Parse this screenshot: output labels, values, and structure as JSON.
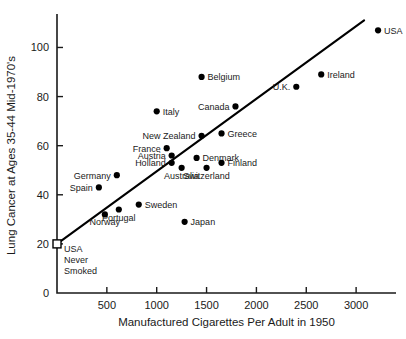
{
  "chart_data": {
    "type": "scatter",
    "title": "",
    "xlabel": "Manufactured Cigarettes Per Adult in 1950",
    "ylabel": "Lung Cancer at Ages 35-44 Mid-1970's",
    "xlim": [
      0,
      3400
    ],
    "ylim": [
      0,
      112
    ],
    "grid": false,
    "legend": "none",
    "xticks": [
      500,
      1000,
      1500,
      2000,
      2500,
      3000
    ],
    "xtick_labels": [
      "500",
      "1000",
      "1500",
      "2000",
      "2500",
      "3000"
    ],
    "yticks": [
      0,
      20,
      40,
      60,
      80,
      100
    ],
    "ytick_labels": [
      "0",
      "20",
      "40",
      "60",
      "80",
      "100"
    ],
    "points": [
      {
        "name": "USA",
        "x": 3220,
        "y": 107,
        "label": "USA",
        "label_pos": "right"
      },
      {
        "name": "Ireland",
        "x": 2650,
        "y": 89,
        "label": "Ireland",
        "label_pos": "right"
      },
      {
        "name": "U.K.",
        "x": 2400,
        "y": 84,
        "label": "U.K.",
        "label_pos": "left"
      },
      {
        "name": "Belgium",
        "x": 1450,
        "y": 88,
        "label": "Belgium",
        "label_pos": "right"
      },
      {
        "name": "Canada",
        "x": 1790,
        "y": 76,
        "label": "Canada",
        "label_pos": "left"
      },
      {
        "name": "Italy",
        "x": 1000,
        "y": 74,
        "label": "Italy",
        "label_pos": "right"
      },
      {
        "name": "Greece",
        "x": 1650,
        "y": 65,
        "label": "Greece",
        "label_pos": "right"
      },
      {
        "name": "New Zealand",
        "x": 1450,
        "y": 64,
        "label": "New Zealand",
        "label_pos": "left"
      },
      {
        "name": "France",
        "x": 1100,
        "y": 59,
        "label": "France",
        "label_pos": "left"
      },
      {
        "name": "Austria",
        "x": 1150,
        "y": 56,
        "label": "Austria",
        "label_pos": "left"
      },
      {
        "name": "Holland",
        "x": 1150,
        "y": 53,
        "label": "Holland",
        "label_pos": "left"
      },
      {
        "name": "Denmark",
        "x": 1400,
        "y": 55,
        "label": "Denmark",
        "label_pos": "right"
      },
      {
        "name": "Finland",
        "x": 1650,
        "y": 53,
        "label": "Finland",
        "label_pos": "right"
      },
      {
        "name": "Switzerland",
        "x": 1500,
        "y": 51,
        "label": "Switzerland",
        "label_pos": "below"
      },
      {
        "name": "Australia",
        "x": 1250,
        "y": 51,
        "label": "Australia",
        "label_pos": "below"
      },
      {
        "name": "Germany",
        "x": 600,
        "y": 48,
        "label": "Germany",
        "label_pos": "left"
      },
      {
        "name": "Spain",
        "x": 420,
        "y": 43,
        "label": "Spain",
        "label_pos": "left"
      },
      {
        "name": "Sweden",
        "x": 820,
        "y": 36,
        "label": "Sweden",
        "label_pos": "right"
      },
      {
        "name": "Portugal",
        "x": 620,
        "y": 34,
        "label": "Portugal",
        "label_pos": "below"
      },
      {
        "name": "Norway",
        "x": 480,
        "y": 32,
        "label": "Norway",
        "label_pos": "below"
      },
      {
        "name": "Japan",
        "x": 1280,
        "y": 29,
        "label": "Japan",
        "label_pos": "right"
      }
    ],
    "reference_point": {
      "name": "USA Never Smoked",
      "x": 0,
      "y": 20,
      "marker": "open-square",
      "label_lines": [
        "USA",
        "Never",
        "Smoked"
      ]
    },
    "trendline": {
      "x0": 0,
      "y0": 20,
      "x1": 3080,
      "y1": 111,
      "description": "fitted straight line through USA Never Smoked reference point"
    }
  }
}
